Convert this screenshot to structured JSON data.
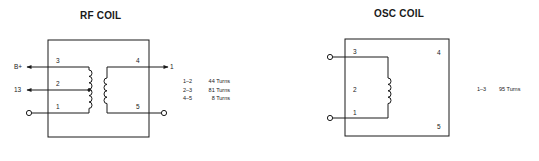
{
  "rf_coil": {
    "title": "RF COIL",
    "pins": {
      "p1": "1",
      "p2": "2",
      "p3": "3",
      "p4": "4",
      "p5": "5"
    },
    "external_labels": {
      "b_plus": "B+",
      "tap": "13",
      "output": "1"
    },
    "specs": [
      {
        "pins": "1–2",
        "turns": "44 Turns"
      },
      {
        "pins": "2–3",
        "turns": "81 Turns"
      },
      {
        "pins": "4–5",
        "turns": "8 Turns"
      }
    ]
  },
  "osc_coil": {
    "title": "OSC COIL",
    "pins": {
      "p1": "1",
      "p2": "2",
      "p3": "3",
      "p4": "4",
      "p5": "5"
    },
    "specs": [
      {
        "pins": "1–3",
        "turns": "95 Turns"
      }
    ]
  },
  "colors": {
    "line": "#1a1a1a",
    "background": "#ffffff"
  }
}
